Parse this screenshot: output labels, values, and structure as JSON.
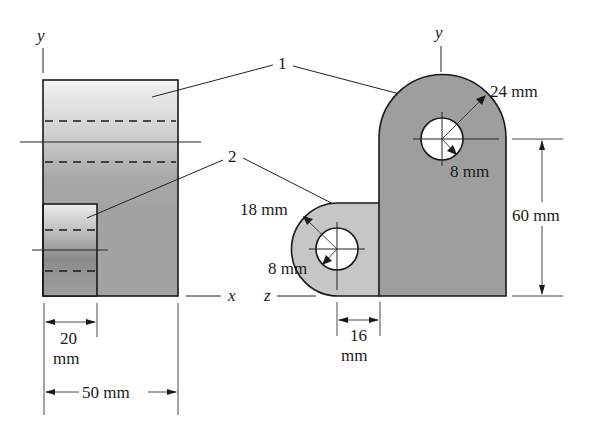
{
  "figure": {
    "left_view": {
      "axis_y": "y",
      "axis_x": "x",
      "dim_inner_width": {
        "value": "20",
        "unit": "mm"
      },
      "dim_total_width": "50 mm"
    },
    "right_view": {
      "axis_y": "y",
      "axis_z": "z",
      "part1_outer_radius": "24 mm",
      "part1_hole_radius": "8 mm",
      "part1_height": "60 mm",
      "part2_outer_radius": "18 mm",
      "part2_hole_radius": "8 mm",
      "part2_offset": {
        "value": "16",
        "unit": "mm"
      }
    },
    "part_labels": [
      "1",
      "2"
    ]
  },
  "colors": {
    "part1_fill": "#9a9a9a",
    "part2_fill": "#c4c4c4",
    "line": "#1a1a1a",
    "background": "#ffffff"
  }
}
